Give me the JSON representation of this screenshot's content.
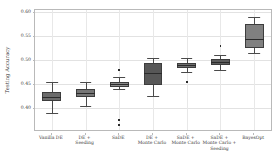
{
  "chart_data": {
    "type": "box",
    "title": "",
    "xlabel": "",
    "ylabel": "Testing Accuracy",
    "ylim": [
      0.355,
      0.605
    ],
    "yticks": [
      0.4,
      0.45,
      0.5,
      0.55,
      0.6
    ],
    "ytick_labels": [
      "0.40",
      "0.45",
      "0.50",
      "0.55",
      "0.60"
    ],
    "grid": true,
    "legend": null,
    "categories": [
      "Vanilla DE",
      "DE +\nSeeding",
      "SaDE",
      "DE +\nMonte Carlo",
      "SaDE +\nMonte Carlo",
      "SaDE +\nMonte Carlo +\nSeeding",
      "BayesOpt"
    ],
    "boxes": [
      {
        "label": "Vanilla DE",
        "whisker_low": 0.39,
        "q1": 0.4145,
        "median": 0.4235,
        "q3": 0.435,
        "whisker_high": 0.455,
        "fliers": []
      },
      {
        "label": "DE + Seeding",
        "whisker_low": 0.4055,
        "q1": 0.4245,
        "median": 0.432,
        "q3": 0.44,
        "whisker_high": 0.455,
        "fliers": []
      },
      {
        "label": "SaDE",
        "whisker_low": 0.44,
        "q1": 0.445,
        "median": 0.45,
        "q3": 0.4555,
        "whisker_high": 0.465,
        "fliers": [
          0.4805,
          0.376,
          0.3655
        ]
      },
      {
        "label": "DE + Monte Carlo",
        "whisker_low": 0.425,
        "q1": 0.4495,
        "median": 0.473,
        "q3": 0.495,
        "whisker_high": 0.5055,
        "fliers": []
      },
      {
        "label": "SaDE + Monte Carlo",
        "whisker_low": 0.4755,
        "q1": 0.4835,
        "median": 0.4895,
        "q3": 0.495,
        "whisker_high": 0.505,
        "fliers": [
          0.4555
        ]
      },
      {
        "label": "SaDE + Monte Carlo + Seeding",
        "whisker_low": 0.48,
        "q1": 0.4905,
        "median": 0.497,
        "q3": 0.5035,
        "whisker_high": 0.5105,
        "fliers": [
          0.53
        ]
      },
      {
        "label": "BayesOpt",
        "whisker_low": 0.5155,
        "q1": 0.5255,
        "median": 0.5455,
        "q3": 0.5755,
        "whisker_high": 0.59,
        "fliers": []
      }
    ],
    "box_colors": [
      "#6b6b6b",
      "#767676",
      "#8a8a8a",
      "#575757",
      "#6e6e6e",
      "#5c5c5c",
      "#808080"
    ]
  }
}
